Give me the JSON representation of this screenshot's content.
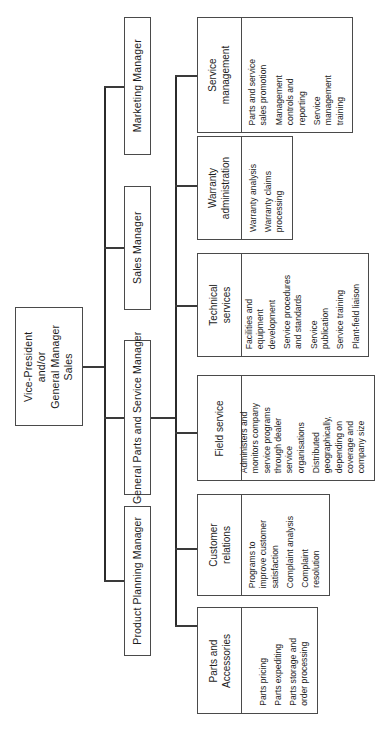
{
  "diagram": {
    "orientation": "rotated-90"
  },
  "root": {
    "label": "Vice-President\nand/or\nGeneral Manager\nSales"
  },
  "managers": [
    {
      "label": "Marketing Manager"
    },
    {
      "label": "Sales Manager"
    },
    {
      "label": "General Parts and Service Manager"
    },
    {
      "label": "Product Planning Manager"
    }
  ],
  "units": [
    {
      "title": "Service\nmanagement",
      "items": [
        "Service\nmanagement\ntraining",
        "Management\ncontrols and\nreporting",
        "Parts and service\nsales promotion"
      ]
    },
    {
      "title": "Warranty\nadministration",
      "items": [
        "Warranty claims\nprocessing",
        "Warranty analysis"
      ]
    },
    {
      "title": "Technical\nservices",
      "items": [
        "Plant-field liaison",
        "Service training",
        "Service\npublication",
        "Service procedures\nand standards",
        "Facilities and\nequipment\ndevelopment"
      ]
    },
    {
      "title": "Field service",
      "items": [
        "Distributed\ngeographically,\ndepending on\ncoverage and\ncompany size",
        "Administers and\nmonitors company\nservice programs\nthrough dealer\nservice\norganisations"
      ]
    },
    {
      "title": "Customer\nrelations",
      "items": [
        "Complaint\nresolution",
        "Complaint analysis",
        "Programs to\nimprove customer\nsatisfaction"
      ]
    },
    {
      "title": "Parts and\nAccessories",
      "items": [
        "Parts storage and\norder processing",
        "Parts expediting",
        "Parts pricing"
      ]
    }
  ],
  "colors": {
    "line": "#3a3a3a",
    "border": "#4a4a4a",
    "background": "#ffffff",
    "text": "#1d1d1d"
  }
}
